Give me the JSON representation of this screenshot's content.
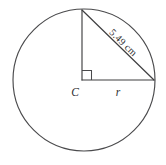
{
  "diagram": {
    "background_color": "#ffffff",
    "stroke_color": "#3f3f41",
    "labels": {
      "center_point": "C",
      "radius_leg": "r",
      "hypotenuse_measure": "5.49 cm"
    },
    "shapes": {
      "circle": {
        "name": "circle",
        "cx": 84,
        "cy": 80,
        "r": 71
      },
      "vertical_leg": {
        "name": "vertical-radius",
        "x1": 82,
        "y1": 80,
        "x2": 82,
        "y2": 10
      },
      "horizontal_leg": {
        "name": "horizontal-radius",
        "x1": 82,
        "y1": 80,
        "x2": 154,
        "y2": 80
      },
      "hypotenuse": {
        "name": "hypotenuse",
        "x1": 82,
        "y1": 10,
        "x2": 154,
        "y2": 80
      },
      "right_angle_marker": {
        "name": "right-angle-square",
        "size": 9
      }
    },
    "label_positions": {
      "center_point": {
        "x": 75,
        "y": 96
      },
      "radius_leg": {
        "x": 118,
        "y": 96
      },
      "hypotenuse_measure": {
        "x": 121,
        "y": 45,
        "rotation": 44
      }
    }
  }
}
